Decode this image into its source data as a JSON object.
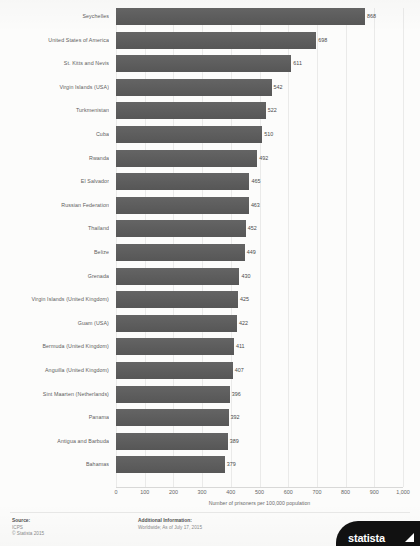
{
  "title_strip": "",
  "chart_data": {
    "type": "bar",
    "orientation": "horizontal",
    "title": "",
    "xlabel": "Number of prisoners per 100,000 population",
    "ylabel": "",
    "xlim": [
      0,
      1000
    ],
    "grid": true,
    "legend": "none",
    "bar_color": "#5c5c5c",
    "tick_labels": [
      "0",
      "100",
      "200",
      "300",
      "400",
      "500",
      "600",
      "700",
      "800",
      "900",
      "1,000"
    ],
    "ticks": [
      0,
      100,
      200,
      300,
      400,
      500,
      600,
      700,
      800,
      900,
      1000
    ],
    "categories": [
      "Seychelles",
      "United States of America",
      "St. Kitts and Nevis",
      "Virgin Islands (USA)",
      "Turkmenistan",
      "Cuba",
      "Rwanda",
      "El Salvador",
      "Russian Federation",
      "Thailand",
      "Belize",
      "Grenada",
      "Virgin Islands (United Kingdom)",
      "Guam (USA)",
      "Bermuda (United Kingdom)",
      "Anguilla (United Kingdom)",
      "Sint Maarten (Netherlands)",
      "Panama",
      "Antigua and Barbuda",
      "Bahamas"
    ],
    "values": [
      868,
      698,
      611,
      542,
      522,
      510,
      492,
      465,
      463,
      452,
      449,
      430,
      425,
      422,
      411,
      407,
      396,
      392,
      389,
      379
    ],
    "value_labels": [
      "868",
      "698",
      "611",
      "542",
      "522",
      "510",
      "492",
      "465",
      "463",
      "452",
      "449",
      "430",
      "425",
      "422",
      "411",
      "407",
      "396",
      "392",
      "389",
      "379"
    ]
  },
  "footer": {
    "source_heading": "Source:",
    "source_lines": [
      "ICPS",
      "© Statista 2015"
    ],
    "info_heading": "Additional Information:",
    "info_lines": [
      "Worldwide; As of July 17, 2015"
    ]
  },
  "logo": {
    "text": "statista",
    "mark": "arrow-mark"
  }
}
